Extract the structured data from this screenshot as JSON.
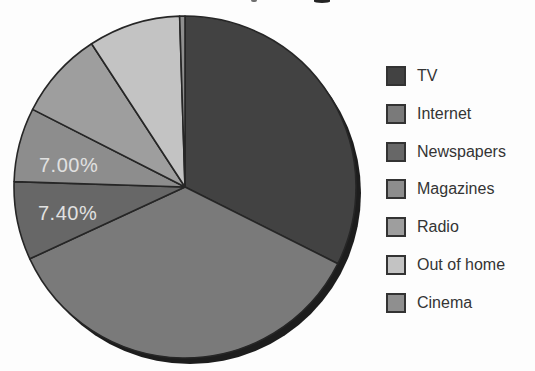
{
  "chart_data": {
    "type": "pie",
    "title": "",
    "direction": "clockwise",
    "start_angle_deg": 0,
    "legend_position": "right",
    "stroke_color": "#262626",
    "shadow_color": "#1d1d1d",
    "label_color": "#e1e1e1",
    "series": [
      {
        "name": "TV",
        "value": 32.4,
        "color": "#424242"
      },
      {
        "name": "Internet",
        "value": 35.7,
        "color": "#7a7a7a"
      },
      {
        "name": "Newspapers",
        "value": 7.4,
        "color": "#676767"
      },
      {
        "name": "Magazines",
        "value": 7.0,
        "color": "#8d8d8d"
      },
      {
        "name": "Radio",
        "value": 8.3,
        "color": "#9e9e9e"
      },
      {
        "name": "Out of home",
        "value": 8.7,
        "color": "#c3c3c3"
      },
      {
        "name": "Cinema",
        "value": 0.5,
        "color": "#8f8f8f"
      }
    ],
    "slice_labels": [
      {
        "text": "7.40%",
        "series": "Newspapers",
        "x": 38,
        "y": 220
      },
      {
        "text": "7.00%",
        "series": "Magazines",
        "x": 39,
        "y": 172
      }
    ]
  }
}
